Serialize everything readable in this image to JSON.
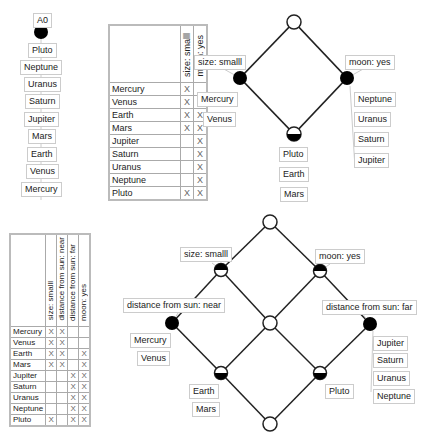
{
  "chain": {
    "attribute": "A0",
    "objects": [
      "Pluto",
      "Neptune",
      "Uranus",
      "Saturn",
      "Jupiter",
      "Mars",
      "Earth",
      "Venus",
      "Mercury"
    ]
  },
  "context1": {
    "attributes": [
      "size: smalll",
      "moon: yes"
    ],
    "rows": [
      {
        "object": "Mercury",
        "marks": [
          "X",
          ""
        ]
      },
      {
        "object": "Venus",
        "marks": [
          "X",
          ""
        ]
      },
      {
        "object": "Earth",
        "marks": [
          "X",
          "X"
        ]
      },
      {
        "object": "Mars",
        "marks": [
          "X",
          "X"
        ]
      },
      {
        "object": "Jupiter",
        "marks": [
          "",
          "X"
        ]
      },
      {
        "object": "Saturn",
        "marks": [
          "",
          "X"
        ]
      },
      {
        "object": "Uranus",
        "marks": [
          "",
          "X"
        ]
      },
      {
        "object": "Neptune",
        "marks": [
          "",
          "X"
        ]
      },
      {
        "object": "Pluto",
        "marks": [
          "X",
          "X"
        ]
      }
    ]
  },
  "lattice1": {
    "attr_left": "size: smalll",
    "attr_right": "moon: yes",
    "objs_left": [
      "Mercury",
      "Venus"
    ],
    "objs_right": [
      "Neptune",
      "Uranus",
      "Saturn",
      "Jupiter"
    ],
    "objs_bottom": [
      "Pluto",
      "Earth",
      "Mars"
    ]
  },
  "context2": {
    "attributes": [
      "size: smalll",
      "distance from sun: near",
      "distance from sun: far",
      "moon: yes"
    ],
    "rows": [
      {
        "object": "Mercury",
        "marks": [
          "X",
          "X",
          "",
          ""
        ]
      },
      {
        "object": "Venus",
        "marks": [
          "X",
          "X",
          "",
          ""
        ]
      },
      {
        "object": "Earth",
        "marks": [
          "X",
          "X",
          "",
          "X"
        ]
      },
      {
        "object": "Mars",
        "marks": [
          "X",
          "X",
          "",
          "X"
        ]
      },
      {
        "object": "Jupiter",
        "marks": [
          "",
          "",
          "X",
          "X"
        ]
      },
      {
        "object": "Saturn",
        "marks": [
          "",
          "",
          "X",
          "X"
        ]
      },
      {
        "object": "Uranus",
        "marks": [
          "",
          "",
          "X",
          "X"
        ]
      },
      {
        "object": "Neptune",
        "marks": [
          "",
          "",
          "X",
          "X"
        ]
      },
      {
        "object": "Pluto",
        "marks": [
          "X",
          "",
          "X",
          "X"
        ]
      }
    ]
  },
  "lattice2": {
    "attr_size": "size: smalll",
    "attr_moon": "moon: yes",
    "attr_near": "distance from sun: near",
    "attr_far": "distance from sun: far",
    "objs_near": [
      "Mercury",
      "Venus"
    ],
    "objs_far": [
      "Jupiter",
      "Saturn",
      "Uranus",
      "Neptune"
    ],
    "objs_earth": [
      "Earth",
      "Mars"
    ],
    "objs_pluto": [
      "Pluto"
    ]
  }
}
